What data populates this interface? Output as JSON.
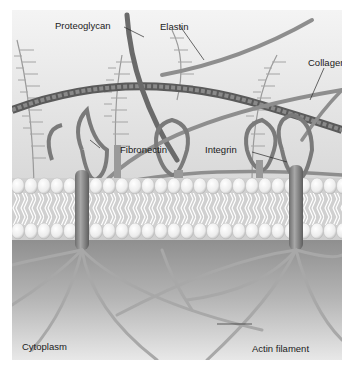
{
  "figure": {
    "labels": {
      "proteoglycan": "Proteoglycan",
      "elastin": "Elastin",
      "collagen": "Collagen",
      "fibronectin": "Fibronectin",
      "integrin": "Integrin",
      "cytoplasm": "Cytoplasm",
      "actin_filament": "Actin filament"
    },
    "colors": {
      "background_top": "#f2f2f2",
      "background_mid": "#dcdcdc",
      "membrane_head": "#f7f7f7",
      "membrane_shadow": "#b5b5b5",
      "cytoplasm_top": "#8e8e8e",
      "cytoplasm_bottom": "#e6e6e6",
      "fiber": "#8a8a8a",
      "fiber_dark": "#5c5c5c",
      "text": "#1a1a1a"
    }
  }
}
